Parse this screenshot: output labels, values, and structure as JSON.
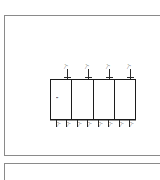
{
  "document": {
    "type": "cad-elevation-drawing",
    "background_color": "#ffffff",
    "line_color": "#1c1c1c",
    "sheet_border_color": "#8a8a8a"
  },
  "sheets": [
    {
      "name": "sheet-primary",
      "label": ""
    },
    {
      "name": "sheet-secondary",
      "label": ""
    }
  ],
  "drawing": {
    "title": "",
    "cells": [
      {
        "id": "cell-1",
        "interior_label": "▪▪"
      },
      {
        "id": "cell-2",
        "interior_label": ""
      },
      {
        "id": "cell-3",
        "interior_label": ""
      },
      {
        "id": "cell-4",
        "interior_label": ""
      }
    ],
    "top_dimensions": [
      {
        "id": "dim-top-1",
        "text": "—|"
      },
      {
        "id": "dim-top-2",
        "text": "—|"
      },
      {
        "id": "dim-top-3",
        "text": "—|"
      },
      {
        "id": "dim-top-4",
        "text": "—|"
      }
    ],
    "bottom_dimensions": [
      {
        "id": "dim-bot-1",
        "text": "—|"
      },
      {
        "id": "dim-bot-2",
        "text": "—|"
      },
      {
        "id": "dim-bot-3",
        "text": "—|"
      },
      {
        "id": "dim-bot-4",
        "text": "—|"
      },
      {
        "id": "dim-bot-5",
        "text": "—|"
      },
      {
        "id": "dim-bot-6",
        "text": "—|"
      },
      {
        "id": "dim-bot-7",
        "text": "—|"
      },
      {
        "id": "dim-bot-8",
        "text": "—|"
      }
    ]
  }
}
